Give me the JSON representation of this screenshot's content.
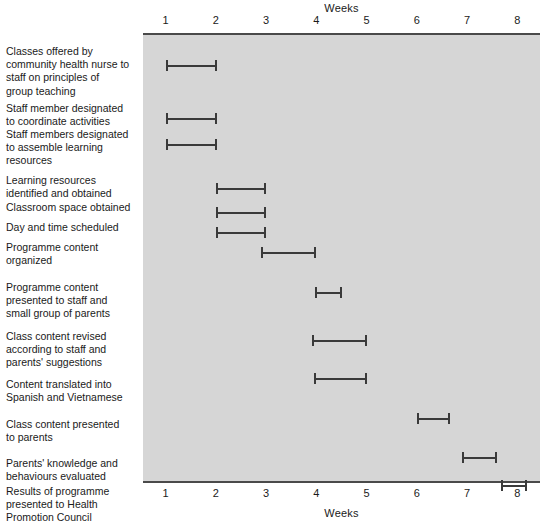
{
  "chart_data": {
    "type": "bar",
    "subtype": "gantt",
    "title": "",
    "xlabel": "Weeks",
    "ylabel": "",
    "top_axis_title": "Weeks",
    "bottom_axis_title": "Weeks",
    "xlim": [
      0.55,
      8.45
    ],
    "xticks": [
      1,
      2,
      3,
      4,
      5,
      6,
      7,
      8
    ],
    "xtick_labels": [
      "1",
      "2",
      "3",
      "4",
      "5",
      "6",
      "7",
      "8"
    ],
    "grid": false,
    "legend": null,
    "plot_background": "#d6d6d6",
    "bar_color": "#3a3a3a",
    "axis_color": "#4a4a4a",
    "categories": [
      "Classes offered by community health nurse to staff on principles of group teaching",
      "Staff member designated to coordinate activities",
      "Staff members designated to assemble learning resources",
      "Learning resources identified and obtained",
      "Classroom space obtained",
      "Day and time scheduled",
      "Programme content organized",
      "Programme content presented to staff and small group of parents",
      "Class content revised according to staff and parents' suggestions",
      "Content translated into Spanish and Vietnamese",
      "Class content presented to parents",
      "Parents' knowledge and behaviours evaluated",
      "Results of programme presented to Health Promotion Council"
    ],
    "tasks": [
      {
        "label_lines": [
          "Classes offered by",
          "community health nurse to",
          "staff on principles of",
          "group teaching"
        ],
        "start_week": 1.0,
        "end_week": 2.02,
        "label_top": 12,
        "bar_top": 25
      },
      {
        "label_lines": [
          "Staff member designated",
          "to coordinate activities"
        ],
        "start_week": 1.0,
        "end_week": 2.02,
        "label_top": 69,
        "bar_top": 78
      },
      {
        "label_lines": [
          "Staff members designated",
          "to assemble learning",
          "resources"
        ],
        "start_week": 1.0,
        "end_week": 2.02,
        "label_top": 95,
        "bar_top": 104
      },
      {
        "label_lines": [
          "Learning resources",
          "identified and obtained"
        ],
        "start_week": 2.0,
        "end_week": 3.0,
        "label_top": 141,
        "bar_top": 148
      },
      {
        "label_lines": [
          "Classroom space obtained"
        ],
        "start_week": 2.0,
        "end_week": 3.0,
        "label_top": 168,
        "bar_top": 172
      },
      {
        "label_lines": [
          "Day and time scheduled"
        ],
        "start_week": 2.0,
        "end_week": 3.0,
        "label_top": 188,
        "bar_top": 192
      },
      {
        "label_lines": [
          "Programme content",
          "organized"
        ],
        "start_week": 2.9,
        "end_week": 4.0,
        "label_top": 208,
        "bar_top": 212
      },
      {
        "label_lines": [
          "Programme content",
          "presented to staff and",
          "small group of parents"
        ],
        "start_week": 3.98,
        "end_week": 4.52,
        "label_top": 248,
        "bar_top": 252
      },
      {
        "label_lines": [
          "Class content revised",
          "according to staff and",
          "parents' suggestions"
        ],
        "start_week": 3.92,
        "end_week": 5.0,
        "label_top": 297,
        "bar_top": 300
      },
      {
        "label_lines": [
          "Content translated into",
          "Spanish and Vietnamese"
        ],
        "start_week": 3.95,
        "end_week": 5.0,
        "label_top": 345,
        "bar_top": 338
      },
      {
        "label_lines": [
          "Class content presented",
          "to parents"
        ],
        "start_week": 6.0,
        "end_week": 6.65,
        "label_top": 385,
        "bar_top": 378
      },
      {
        "label_lines": [
          "Parents' knowledge and",
          "behaviours evaluated"
        ],
        "start_week": 6.9,
        "end_week": 7.6,
        "label_top": 424,
        "bar_top": 417
      },
      {
        "label_lines": [
          "Results of programme",
          "presented to Health",
          "Promotion Council"
        ],
        "start_week": 7.68,
        "end_week": 8.2,
        "label_top": 452,
        "bar_top": 445
      }
    ]
  }
}
